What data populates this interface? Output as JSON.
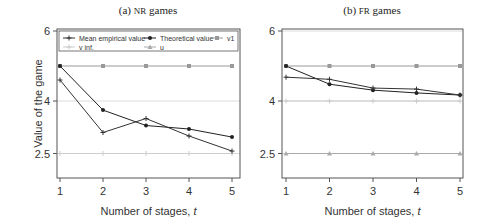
{
  "chart_data": [
    {
      "type": "line",
      "title": "(a) NR games",
      "title_prefix": "(a)",
      "title_sc": "NR",
      "title_suffix": "games",
      "xlabel": "Number of stages, t",
      "ylabel": "Value of the game",
      "x": [
        1,
        2,
        3,
        4,
        5
      ],
      "xticks": [
        "1",
        "2",
        "3",
        "4",
        "5"
      ],
      "yticks": [
        "2.5",
        "4",
        "6"
      ],
      "ylim": [
        1.8,
        6.05
      ],
      "grid": "horizontal",
      "legend_position": "top-inside",
      "series": [
        {
          "name": "Mean empirical value",
          "values": [
            4.6,
            3.1,
            3.5,
            3.0,
            2.57
          ],
          "color": "#333333",
          "marker": "plus"
        },
        {
          "name": "Theoretical value",
          "values": [
            5.0,
            3.74,
            3.3,
            3.2,
            2.97
          ],
          "color": "#222222",
          "marker": "dot"
        },
        {
          "name": "v1",
          "values": [
            5.0,
            5.0,
            5.0,
            5.0,
            5.0
          ],
          "color": "#999999",
          "marker": "square"
        },
        {
          "name": "v inf.",
          "values": [
            2.5,
            2.5,
            2.5,
            2.5,
            2.5
          ],
          "color": "#cccccc",
          "marker": "plus"
        },
        {
          "name": "u",
          "values": [],
          "color": "#aaaaaa",
          "marker": "triangle"
        }
      ]
    },
    {
      "type": "line",
      "title": "(b) FR games",
      "title_prefix": "(b)",
      "title_sc": "FR",
      "title_suffix": "games",
      "xlabel": "Number of stages, t",
      "ylabel": "",
      "x": [
        1,
        2,
        3,
        4,
        5
      ],
      "xticks": [
        "1",
        "2",
        "3",
        "4",
        "5"
      ],
      "yticks": [
        "2.5",
        "4",
        "6"
      ],
      "ylim": [
        1.8,
        6.05
      ],
      "grid": "horizontal",
      "legend_position": "none",
      "series": [
        {
          "name": "Mean empirical value",
          "values": [
            4.68,
            4.62,
            4.37,
            4.34,
            4.17
          ],
          "color": "#333333",
          "marker": "plus"
        },
        {
          "name": "Theoretical value",
          "values": [
            5.0,
            4.48,
            4.31,
            4.23,
            4.17
          ],
          "color": "#222222",
          "marker": "dot"
        },
        {
          "name": "v1",
          "values": [
            5.0,
            5.0,
            5.0,
            5.0,
            5.0
          ],
          "color": "#999999",
          "marker": "square"
        },
        {
          "name": "v inf.",
          "values": [
            4.0,
            4.0,
            4.0,
            4.0,
            4.0
          ],
          "color": "#cccccc",
          "marker": "plus"
        },
        {
          "name": "u",
          "values": [
            2.5,
            2.5,
            2.5,
            2.5,
            2.5
          ],
          "color": "#aaaaaa",
          "marker": "triangle"
        }
      ]
    }
  ],
  "legend": {
    "items": [
      "Mean empirical value",
      "Theoretical value",
      "v1",
      "v inf.",
      "u"
    ]
  }
}
